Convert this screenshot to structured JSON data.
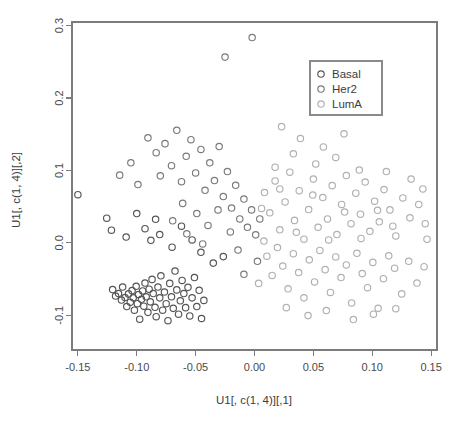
{
  "chart_data": {
    "type": "scatter",
    "title": "",
    "xlabel": "U1[, c(1, 4)][,1]",
    "ylabel": "U1[, c(1, 4)][,2]",
    "xlim": [
      -0.155,
      0.155
    ],
    "ylim": [
      -0.148,
      0.305
    ],
    "xticks": [
      -0.15,
      -0.1,
      -0.05,
      0.0,
      0.05,
      0.1,
      0.15
    ],
    "xtick_labels": [
      "-0.15",
      "-0.10",
      "-0.05",
      "0.00",
      "0.05",
      "0.10",
      "0.15"
    ],
    "yticks": [
      -0.1,
      0.0,
      0.1,
      0.2,
      0.3
    ],
    "ytick_labels": [
      "-0.1",
      "0.0",
      "0.1",
      "0.2",
      "0.3"
    ],
    "grid": false,
    "marker": "open-circle",
    "marker_size": 3.2,
    "legend_position": "top-right",
    "legend_entries": [
      "Basal",
      "Her2",
      "LumA"
    ],
    "series": [
      {
        "name": "Basal",
        "color": "#555555",
        "points": [
          [
            -0.15,
            0.0665
          ],
          [
            -0.1205,
            -0.0645
          ],
          [
            -0.118,
            -0.0735
          ],
          [
            -0.1155,
            -0.07
          ],
          [
            -0.113,
            -0.079
          ],
          [
            -0.112,
            -0.061
          ],
          [
            -0.11,
            -0.0755
          ],
          [
            -0.1085,
            -0.088
          ],
          [
            -0.107,
            -0.0705
          ],
          [
            -0.1055,
            -0.082
          ],
          [
            -0.104,
            -0.066
          ],
          [
            -0.103,
            -0.076
          ],
          [
            -0.102,
            -0.093
          ],
          [
            -0.1005,
            -0.06
          ],
          [
            -0.0995,
            -0.084
          ],
          [
            -0.0985,
            -0.0715
          ],
          [
            -0.0975,
            -0.1055
          ],
          [
            -0.096,
            -0.078
          ],
          [
            -0.095,
            -0.0665
          ],
          [
            -0.094,
            -0.0875
          ],
          [
            -0.093,
            -0.0555
          ],
          [
            -0.092,
            -0.0745
          ],
          [
            -0.0905,
            -0.096
          ],
          [
            -0.0895,
            -0.064
          ],
          [
            -0.0885,
            -0.0815
          ],
          [
            -0.087,
            -0.0505
          ],
          [
            -0.086,
            -0.07
          ],
          [
            -0.0845,
            -0.089
          ],
          [
            -0.0835,
            -0.102
          ],
          [
            -0.082,
            -0.061
          ],
          [
            -0.0805,
            -0.076
          ],
          [
            -0.0795,
            -0.0455
          ],
          [
            -0.078,
            -0.093
          ],
          [
            -0.0765,
            -0.068
          ],
          [
            -0.075,
            -0.084
          ],
          [
            -0.0735,
            -0.1075
          ],
          [
            -0.072,
            -0.056
          ],
          [
            -0.0705,
            -0.0745
          ],
          [
            -0.069,
            -0.0905
          ],
          [
            -0.0675,
            -0.039
          ],
          [
            -0.066,
            -0.065
          ],
          [
            -0.0645,
            -0.0985
          ],
          [
            -0.063,
            -0.08
          ],
          [
            -0.0615,
            -0.052
          ],
          [
            -0.06,
            -0.07
          ],
          [
            -0.0585,
            -0.0895
          ],
          [
            -0.0565,
            -0.0615
          ],
          [
            -0.055,
            -0.101
          ],
          [
            -0.053,
            -0.076
          ],
          [
            -0.051,
            -0.048
          ],
          [
            -0.049,
            -0.088
          ],
          [
            -0.047,
            -0.0655
          ],
          [
            -0.045,
            -0.1045
          ],
          [
            -0.043,
            -0.0795
          ],
          [
            -0.1215,
            0.0175
          ],
          [
            -0.109,
            0.008
          ],
          [
            -0.093,
            0.0195
          ],
          [
            -0.088,
            0.0035
          ],
          [
            -0.0805,
            0.0115
          ],
          [
            -0.07,
            -0.006
          ],
          [
            -0.062,
            0.023
          ],
          [
            -0.053,
            0.004
          ],
          [
            -0.0455,
            -0.013
          ],
          [
            -0.035,
            -0.028
          ],
          [
            -0.0265,
            -0.019
          ],
          [
            -0.1255,
            0.034
          ],
          [
            -0.1,
            0.0405
          ],
          [
            -0.084,
            0.0325
          ]
        ]
      },
      {
        "name": "Her2",
        "color": "#7a7a7a",
        "points": [
          [
            -0.0835,
            0.1245
          ],
          [
            -0.08,
            0.0925
          ],
          [
            -0.076,
            0.137
          ],
          [
            -0.0705,
            0.1065
          ],
          [
            -0.066,
            0.1555
          ],
          [
            -0.062,
            0.0845
          ],
          [
            -0.058,
            0.1195
          ],
          [
            -0.054,
            0.1425
          ],
          [
            -0.05,
            0.0965
          ],
          [
            -0.0455,
            0.129
          ],
          [
            -0.042,
            0.0725
          ],
          [
            -0.038,
            0.1105
          ],
          [
            -0.034,
            0.086
          ],
          [
            -0.03,
            0.133
          ],
          [
            -0.0265,
            0.064
          ],
          [
            -0.023,
            0.0985
          ],
          [
            -0.0195,
            0.048
          ],
          [
            -0.016,
            0.0795
          ],
          [
            -0.0125,
            0.033
          ],
          [
            -0.009,
            0.0605
          ],
          [
            -0.006,
            0.0215
          ],
          [
            -0.0025,
            0.0455
          ],
          [
            0.001,
            0.011
          ],
          [
            0.0045,
            0.033
          ],
          [
            -0.061,
            0.0545
          ],
          [
            -0.049,
            0.0405
          ],
          [
            -0.0395,
            0.024
          ],
          [
            -0.031,
            0.0455
          ],
          [
            -0.0205,
            0.015
          ],
          [
            -0.105,
            0.1105
          ],
          [
            -0.099,
            0.0805
          ],
          [
            -0.0905,
            0.145
          ],
          [
            -0.1145,
            0.0935
          ],
          [
            -0.025,
            0.2565
          ],
          [
            -0.002,
            0.2835
          ],
          [
            -0.0695,
            0.0305
          ],
          [
            -0.0575,
            0.0125
          ],
          [
            -0.044,
            -0.0015
          ],
          [
            -0.014,
            -0.01
          ],
          [
            0.0025,
            -0.0255
          ],
          [
            -0.009,
            -0.0435
          ]
        ]
      },
      {
        "name": "LumA",
        "color": "#b0b0b0",
        "points": [
          [
            0.0085,
            0.0695
          ],
          [
            0.013,
            0.0415
          ],
          [
            0.0175,
            0.0855
          ],
          [
            0.0215,
            0.018
          ],
          [
            0.026,
            0.0565
          ],
          [
            0.03,
            0.0975
          ],
          [
            0.034,
            0.031
          ],
          [
            0.038,
            0.072
          ],
          [
            0.042,
            0.005
          ],
          [
            0.046,
            0.046
          ],
          [
            0.05,
            0.088
          ],
          [
            0.054,
            0.0215
          ],
          [
            0.058,
            0.0625
          ],
          [
            0.062,
            0.033
          ],
          [
            0.066,
            0.079
          ],
          [
            0.07,
            0.0115
          ],
          [
            0.074,
            0.053
          ],
          [
            0.078,
            0.093
          ],
          [
            0.082,
            0.0265
          ],
          [
            0.086,
            0.0685
          ],
          [
            0.09,
            0.0395
          ],
          [
            0.094,
            0.084
          ],
          [
            0.098,
            0.016
          ],
          [
            0.102,
            0.0575
          ],
          [
            0.106,
            0.029
          ],
          [
            0.11,
            0.0735
          ],
          [
            0.115,
            0.0455
          ],
          [
            0.12,
            0.0095
          ],
          [
            0.126,
            0.062
          ],
          [
            0.132,
            0.0345
          ],
          [
            0.1395,
            0.053
          ],
          [
            0.145,
            0.0265
          ],
          [
            0.0105,
            -0.0185
          ],
          [
            0.015,
            -0.045
          ],
          [
            0.0195,
            -0.0065
          ],
          [
            0.024,
            -0.032
          ],
          [
            0.0285,
            -0.0635
          ],
          [
            0.033,
            -0.015
          ],
          [
            0.0375,
            -0.041
          ],
          [
            0.042,
            -0.076
          ],
          [
            0.0465,
            -0.0235
          ],
          [
            0.051,
            -0.054
          ],
          [
            0.0555,
            -0.0105
          ],
          [
            0.06,
            -0.037
          ],
          [
            0.0645,
            -0.0685
          ],
          [
            0.069,
            -0.0195
          ],
          [
            0.0735,
            -0.048
          ],
          [
            0.078,
            -0.0305
          ],
          [
            0.0825,
            -0.083
          ],
          [
            0.087,
            -0.0145
          ],
          [
            0.0915,
            -0.0425
          ],
          [
            0.096,
            -0.062
          ],
          [
            0.1005,
            -0.027
          ],
          [
            0.105,
            -0.0905
          ],
          [
            0.1095,
            -0.0495
          ],
          [
            0.114,
            -0.018
          ],
          [
            0.119,
            -0.035
          ],
          [
            0.125,
            -0.0705
          ],
          [
            0.131,
            -0.0255
          ],
          [
            0.138,
            -0.0555
          ],
          [
            0.144,
            -0.033
          ],
          [
            0.008,
            0.0025
          ],
          [
            0.0215,
            0.0745
          ],
          [
            0.0355,
            0.0145
          ],
          [
            0.0495,
            0.066
          ],
          [
            0.063,
            0.004
          ],
          [
            0.0765,
            0.0425
          ],
          [
            0.0905,
            0.006
          ],
          [
            0.1045,
            0.045
          ],
          [
            0.1175,
            0.023
          ],
          [
            0.027,
            -0.0895
          ],
          [
            0.0455,
            -0.1005
          ],
          [
            0.061,
            -0.0935
          ],
          [
            0.084,
            -0.106
          ],
          [
            0.101,
            -0.0985
          ],
          [
            0.12,
            -0.091
          ],
          [
            0.0175,
            0.1045
          ],
          [
            0.033,
            0.123
          ],
          [
            0.052,
            0.109
          ],
          [
            0.069,
            0.118
          ],
          [
            0.089,
            0.1005
          ],
          [
            0.112,
            0.0985
          ],
          [
            0.133,
            0.088
          ],
          [
            0.039,
            0.144
          ],
          [
            0.0585,
            0.1325
          ],
          [
            0.076,
            0.1505
          ],
          [
            0.023,
            0.1605
          ],
          [
            0.143,
            0.0745
          ],
          [
            0.1465,
            0.005
          ],
          [
            0.006,
            0.0475
          ],
          [
            0.0035,
            -0.056
          ]
        ]
      }
    ]
  },
  "legend": {
    "items": [
      {
        "label": "Basal",
        "color": "#555555"
      },
      {
        "label": "Her2",
        "color": "#7a7a7a"
      },
      {
        "label": "LumA",
        "color": "#b0b0b0"
      }
    ]
  }
}
